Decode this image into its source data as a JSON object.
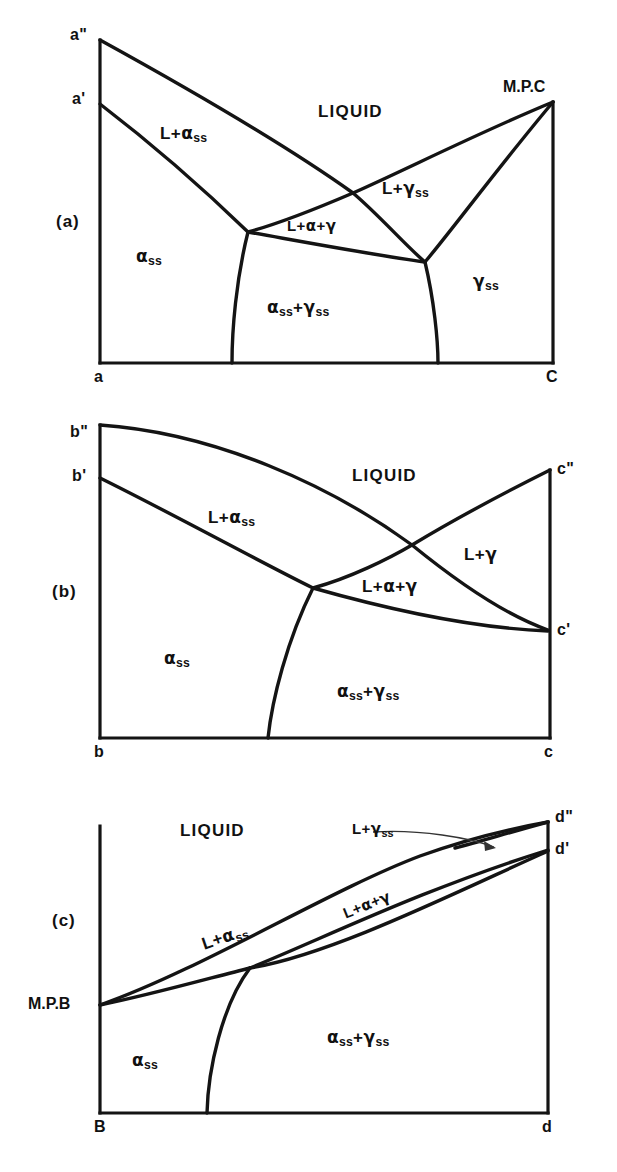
{
  "figure": {
    "panel_count": 3,
    "line_color": "#141414",
    "background_color": "#ffffff"
  },
  "panels": [
    {
      "tag": "(a)",
      "axis_corners": {
        "left_top_upper": "a\"",
        "left_top_lower": "a'",
        "left_bottom": "a",
        "right_bottom": "C",
        "right_top": "M.P.C"
      },
      "regions": [
        {
          "id": "liquid",
          "text": "LIQUID"
        },
        {
          "id": "l-alpha-ss",
          "text": "L+αss"
        },
        {
          "id": "l-gamma-ss",
          "text": "L+γss"
        },
        {
          "id": "l-alpha-gamma",
          "text": "L+α+γ"
        },
        {
          "id": "alpha-ss",
          "text": "αss"
        },
        {
          "id": "gamma-ss",
          "text": "γss"
        },
        {
          "id": "alpha-gamma-ss",
          "text": "αss+γss"
        }
      ]
    },
    {
      "tag": "(b)",
      "axis_corners": {
        "left_top_upper": "b\"",
        "left_top_lower": "b'",
        "left_bottom": "b",
        "right_bottom": "c",
        "right_top_upper": "c\"",
        "right_top_lower": "c'"
      },
      "regions": [
        {
          "id": "liquid",
          "text": "LIQUID"
        },
        {
          "id": "l-alpha-ss",
          "text": "L+αss"
        },
        {
          "id": "l-gamma",
          "text": "L+γ"
        },
        {
          "id": "l-alpha-gamma",
          "text": "L+α+γ"
        },
        {
          "id": "alpha-ss",
          "text": "αss"
        },
        {
          "id": "alpha-gamma-ss",
          "text": "αss+γss"
        }
      ]
    },
    {
      "tag": "(c)",
      "axis_corners": {
        "left_melting_point": "M.P.B",
        "left_bottom": "B",
        "right_bottom": "d",
        "right_top_upper": "d\"",
        "right_top_lower": "d'"
      },
      "regions": [
        {
          "id": "liquid",
          "text": "LIQUID"
        },
        {
          "id": "l-gamma-ss",
          "text": "L+γss"
        },
        {
          "id": "l-alpha-ss",
          "text": "L+αss"
        },
        {
          "id": "l-alpha-gamma",
          "text": "L+α+γ"
        },
        {
          "id": "alpha-ss",
          "text": "αss"
        },
        {
          "id": "alpha-gamma-ss",
          "text": "αss+γss"
        }
      ],
      "annotation_arrow": {
        "from_label": "L+γss",
        "points_to": "narrow L+γss wedge near d\""
      }
    }
  ],
  "labels": {
    "liquid": "LIQUID",
    "L": "L",
    "plus": "+",
    "alpha": "α",
    "gamma": "γ",
    "ss": "ss",
    "panel_a_tag": "(a)",
    "panel_b_tag": "(b)",
    "panel_c_tag": "(c)",
    "a_double_prime": "a\"",
    "a_prime": "a'",
    "a": "a",
    "C": "C",
    "MPC": "M.P.C",
    "b_double_prime": "b\"",
    "b_prime": "b'",
    "b": "b",
    "c": "c",
    "c_double_prime": "c\"",
    "c_prime": "c'",
    "MPB": "M.P.B",
    "B": "B",
    "d": "d",
    "d_double_prime": "d\"",
    "d_prime": "d'"
  }
}
